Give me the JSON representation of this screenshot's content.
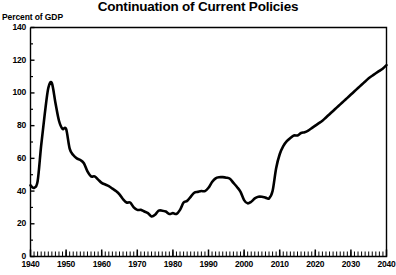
{
  "chart_data": {
    "type": "line",
    "title": "Continuation of Current Policies",
    "ylabel": "Percent of GDP",
    "xlabel": "",
    "xlim": [
      1940,
      2040
    ],
    "ylim": [
      0,
      140
    ],
    "grid": false,
    "legend": "none",
    "y_ticks": [
      0,
      20,
      40,
      60,
      80,
      100,
      120,
      140
    ],
    "x_ticks": [
      1940,
      1950,
      1960,
      1970,
      1980,
      1990,
      2000,
      2010,
      2020,
      2030,
      2040
    ],
    "x_minor_tick_interval": 1,
    "series": [
      {
        "name": "Federal debt held by the public",
        "x": [
          1940,
          1941,
          1942,
          1943,
          1944,
          1945,
          1946,
          1947,
          1948,
          1949,
          1950,
          1951,
          1952,
          1953,
          1954,
          1955,
          1956,
          1957,
          1958,
          1959,
          1960,
          1961,
          1962,
          1963,
          1964,
          1965,
          1966,
          1967,
          1968,
          1969,
          1970,
          1971,
          1972,
          1973,
          1974,
          1975,
          1976,
          1977,
          1978,
          1979,
          1980,
          1981,
          1982,
          1983,
          1984,
          1985,
          1986,
          1987,
          1988,
          1989,
          1990,
          1991,
          1992,
          1993,
          1994,
          1995,
          1996,
          1997,
          1998,
          1999,
          2000,
          2001,
          2002,
          2003,
          2004,
          2005,
          2006,
          2007,
          2008,
          2009,
          2010,
          2011,
          2012,
          2013,
          2014,
          2015,
          2016,
          2017,
          2018,
          2019,
          2020,
          2021,
          2022,
          2023,
          2024,
          2025,
          2026,
          2027,
          2028,
          2029,
          2030,
          2031,
          2032,
          2033,
          2034,
          2035,
          2036,
          2037,
          2038,
          2039,
          2040
        ],
        "values": [
          43.5,
          42.0,
          46.0,
          68.0,
          87.0,
          103.0,
          106.0,
          94.0,
          83.0,
          78.0,
          78.0,
          66.0,
          62.0,
          60.0,
          59.0,
          57.0,
          52.0,
          49.0,
          49.0,
          47.0,
          45.0,
          44.0,
          43.0,
          41.5,
          40.0,
          38.0,
          35.0,
          33.0,
          33.0,
          30.0,
          28.5,
          28.5,
          27.5,
          26.5,
          24.5,
          25.5,
          28.0,
          28.0,
          27.5,
          26.0,
          26.5,
          26.0,
          28.5,
          33.0,
          34.0,
          36.5,
          39.0,
          39.5,
          40.0,
          40.0,
          42.0,
          45.5,
          47.8,
          48.5,
          48.5,
          48.2,
          47.5,
          45.0,
          42.5,
          39.5,
          34.5,
          32.5,
          33.5,
          35.5,
          36.5,
          36.5,
          36.0,
          35.5,
          40.0,
          54.0,
          62.5,
          67.5,
          70.5,
          72.5,
          74.0,
          74.0,
          75.5,
          76.0,
          77.0,
          78.5,
          80.0,
          81.5,
          83.0,
          85.0,
          87.0,
          89.0,
          91.0,
          93.0,
          95.0,
          97.0,
          99.0,
          101.0,
          103.0,
          105.0,
          107.0,
          109.0,
          110.5,
          112.0,
          113.5,
          115.0,
          117.0
        ]
      }
    ]
  }
}
